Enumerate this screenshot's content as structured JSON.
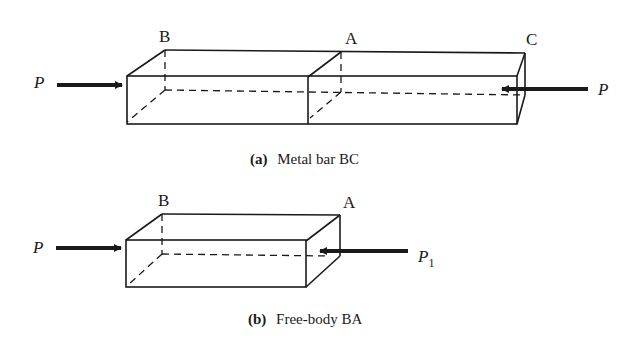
{
  "figure_a": {
    "caption_letter": "(a)",
    "caption_text": "Metal bar BC",
    "labels": {
      "left_end": "B",
      "middle": "A",
      "right_end": "C"
    },
    "forces": {
      "left": "P",
      "right": "P"
    }
  },
  "figure_b": {
    "caption_letter": "(b)",
    "caption_text": "Free-body BA",
    "labels": {
      "left_end": "B",
      "right_end": "A"
    },
    "forces": {
      "left": "P",
      "right": "P",
      "right_subscript": "1"
    }
  },
  "colors": {
    "line": "#1a1a1a",
    "background": "#ffffff"
  }
}
